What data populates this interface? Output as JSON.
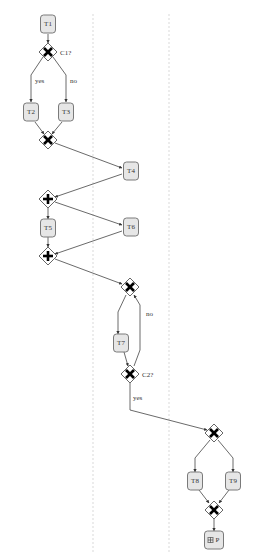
{
  "diagram": {
    "type": "bpmn-process",
    "lanes": [
      {
        "id": "lane-1",
        "x": 93
      },
      {
        "id": "lane-2",
        "x": 169
      }
    ],
    "tasks": [
      {
        "id": "T1",
        "label": "T1",
        "cx": 48,
        "cy": 24
      },
      {
        "id": "T2",
        "label": "T2",
        "cx": 31,
        "cy": 112
      },
      {
        "id": "T3",
        "label": "T3",
        "cx": 66,
        "cy": 112
      },
      {
        "id": "T4",
        "label": "T4",
        "cx": 131,
        "cy": 171
      },
      {
        "id": "T5",
        "label": "T5",
        "cx": 48,
        "cy": 228
      },
      {
        "id": "T6",
        "label": "T6",
        "cx": 131,
        "cy": 227
      },
      {
        "id": "T7",
        "label": "T7",
        "cx": 121,
        "cy": 343
      },
      {
        "id": "T8",
        "label": "T8",
        "cx": 195,
        "cy": 481
      },
      {
        "id": "T9",
        "label": "T9",
        "cx": 233,
        "cy": 481
      },
      {
        "id": "P",
        "label": "P",
        "cx": 214,
        "cy": 540,
        "subprocess": true
      }
    ],
    "gateways": [
      {
        "id": "G1",
        "kind": "exclusive",
        "cx": 48,
        "cy": 52,
        "label": "C1?"
      },
      {
        "id": "G2",
        "kind": "exclusive",
        "cx": 48,
        "cy": 140,
        "label": ""
      },
      {
        "id": "G3",
        "kind": "parallel",
        "cx": 48,
        "cy": 199,
        "label": ""
      },
      {
        "id": "G4",
        "kind": "parallel",
        "cx": 48,
        "cy": 256,
        "label": ""
      },
      {
        "id": "G5",
        "kind": "exclusive",
        "cx": 130,
        "cy": 287,
        "label": ""
      },
      {
        "id": "G6",
        "kind": "exclusive",
        "cx": 130,
        "cy": 374,
        "label": "C2?"
      },
      {
        "id": "G7",
        "kind": "exclusive",
        "cx": 214,
        "cy": 433,
        "label": ""
      },
      {
        "id": "G8",
        "kind": "exclusive",
        "cx": 214,
        "cy": 510,
        "label": ""
      }
    ],
    "edges": [
      {
        "points": [
          [
            48,
            34
          ],
          [
            48,
            43
          ]
        ]
      },
      {
        "points": [
          [
            43,
            57
          ],
          [
            31,
            75
          ],
          [
            31,
            102
          ]
        ],
        "label": "yes",
        "lx": 35,
        "ly": 83
      },
      {
        "points": [
          [
            53,
            57
          ],
          [
            66,
            75
          ],
          [
            66,
            102
          ]
        ],
        "label": "no",
        "lx": 70,
        "ly": 83
      },
      {
        "points": [
          [
            35,
            122
          ],
          [
            44,
            134
          ]
        ]
      },
      {
        "points": [
          [
            62,
            122
          ],
          [
            52,
            134
          ]
        ]
      },
      {
        "points": [
          [
            55,
            143
          ],
          [
            122,
            168
          ]
        ]
      },
      {
        "points": [
          [
            122,
            174
          ],
          [
            55,
            197
          ]
        ]
      },
      {
        "points": [
          [
            48,
            208
          ],
          [
            48,
            219
          ]
        ]
      },
      {
        "points": [
          [
            55,
            202
          ],
          [
            122,
            225
          ]
        ]
      },
      {
        "points": [
          [
            48,
            237
          ],
          [
            48,
            247
          ]
        ]
      },
      {
        "points": [
          [
            122,
            231
          ],
          [
            55,
            254
          ]
        ]
      },
      {
        "points": [
          [
            55,
            259
          ],
          [
            122,
            284
          ]
        ]
      },
      {
        "points": [
          [
            126,
            295
          ],
          [
            118,
            312
          ],
          [
            118,
            334
          ]
        ]
      },
      {
        "points": [
          [
            124,
            352
          ],
          [
            128,
            366
          ]
        ]
      },
      {
        "points": [
          [
            134,
            366
          ],
          [
            140,
            350
          ],
          [
            140,
            305
          ],
          [
            134,
            295
          ]
        ],
        "label": "no",
        "lx": 146,
        "ly": 316
      },
      {
        "points": [
          [
            130,
            383
          ],
          [
            130,
            410
          ],
          [
            207,
            430
          ]
        ],
        "label": "yes",
        "lx": 133,
        "ly": 400
      },
      {
        "points": [
          [
            210,
            440
          ],
          [
            195,
            458
          ],
          [
            195,
            472
          ]
        ]
      },
      {
        "points": [
          [
            218,
            440
          ],
          [
            233,
            458
          ],
          [
            233,
            472
          ]
        ]
      },
      {
        "points": [
          [
            199,
            490
          ],
          [
            209,
            503
          ]
        ]
      },
      {
        "points": [
          [
            229,
            490
          ],
          [
            219,
            503
          ]
        ]
      },
      {
        "points": [
          [
            214,
            519
          ],
          [
            214,
            531
          ]
        ]
      }
    ]
  }
}
